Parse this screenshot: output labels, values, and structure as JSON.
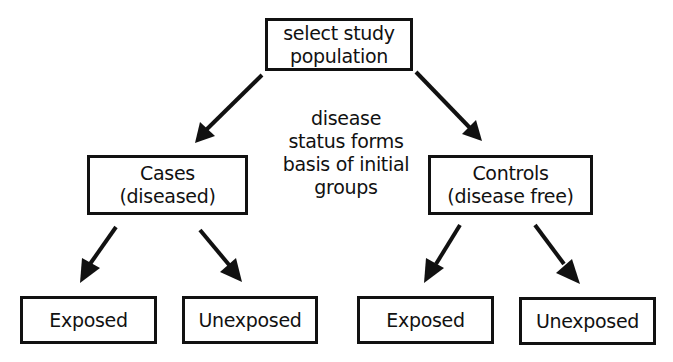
{
  "diagram": {
    "type": "flowchart",
    "root": {
      "lines": [
        "select study",
        "population"
      ]
    },
    "annotation": {
      "lines": [
        "disease",
        "status forms",
        "basis of initial",
        "groups"
      ]
    },
    "groups": [
      {
        "id": "cases",
        "lines": [
          "Cases",
          "(diseased)"
        ],
        "children": [
          {
            "label": "Exposed"
          },
          {
            "label": "Unexposed"
          }
        ]
      },
      {
        "id": "controls",
        "lines": [
          "Controls",
          "(disease free)"
        ],
        "children": [
          {
            "label": "Exposed"
          },
          {
            "label": "Unexposed"
          }
        ]
      }
    ],
    "colors": {
      "stroke": "#111111",
      "background": "#ffffff",
      "text": "#111111"
    }
  }
}
